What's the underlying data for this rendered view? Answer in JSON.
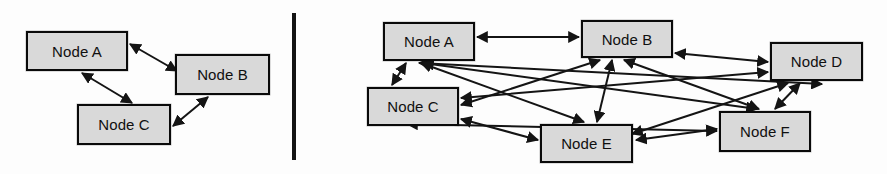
{
  "figure": {
    "background_color": "#fdfdfd",
    "width": 887,
    "height": 174
  },
  "style": {
    "node_fill": "#d9d9d9",
    "node_stroke": "#0a0a0a",
    "edge_color": "#141414",
    "label_color": "#101010",
    "divider_color": "#141414"
  },
  "divider": {
    "name": "panel-divider",
    "x": 292,
    "y": 13,
    "width": 4,
    "height": 147
  },
  "panels": [
    {
      "id": "left-panel",
      "name": "three-node-graph",
      "nodes": [
        {
          "id": "L-A",
          "label": "Node A",
          "x": 26,
          "y": 31,
          "w": 102,
          "h": 40
        },
        {
          "id": "L-B",
          "label": "Node B",
          "x": 175,
          "y": 54,
          "w": 95,
          "h": 41
        },
        {
          "id": "L-C",
          "label": "Node C",
          "x": 77,
          "y": 104,
          "w": 94,
          "h": 41
        }
      ],
      "edges": [
        {
          "from": "L-A",
          "to": "L-B",
          "type": "bidirectional",
          "x1": 130,
          "y1": 44,
          "x2": 177,
          "y2": 71
        },
        {
          "from": "L-A",
          "to": "L-C",
          "type": "bidirectional",
          "x1": 82,
          "y1": 73,
          "x2": 132,
          "y2": 103
        },
        {
          "from": "L-B",
          "to": "L-C",
          "type": "bidirectional",
          "x1": 208,
          "y1": 97,
          "x2": 173,
          "y2": 126
        }
      ]
    },
    {
      "id": "right-panel",
      "name": "six-node-graph",
      "nodes": [
        {
          "id": "R-A",
          "label": "Node A",
          "x": 383,
          "y": 22,
          "w": 92,
          "h": 39
        },
        {
          "id": "R-B",
          "label": "Node B",
          "x": 581,
          "y": 20,
          "w": 92,
          "h": 38
        },
        {
          "id": "R-D",
          "label": "Node D",
          "x": 770,
          "y": 42,
          "w": 93,
          "h": 39
        },
        {
          "id": "R-C",
          "label": "Node C",
          "x": 367,
          "y": 87,
          "w": 92,
          "h": 39
        },
        {
          "id": "R-E",
          "label": "Node E",
          "x": 540,
          "y": 124,
          "w": 93,
          "h": 39
        },
        {
          "id": "R-F",
          "label": "Node F",
          "x": 719,
          "y": 111,
          "w": 92,
          "h": 41
        }
      ],
      "edges": [
        {
          "from": "R-A",
          "to": "R-B",
          "type": "bidirectional",
          "x1": 477,
          "y1": 37,
          "x2": 579,
          "y2": 37
        },
        {
          "from": "R-A",
          "to": "R-C",
          "type": "bidirectional",
          "x1": 406,
          "y1": 63,
          "x2": 392,
          "y2": 85
        },
        {
          "from": "R-A",
          "to": "R-D",
          "type": "bidirectional",
          "x1": 419,
          "y1": 63,
          "x2": 822,
          "y2": 84
        },
        {
          "from": "R-A",
          "to": "R-E",
          "type": "bidirectional",
          "x1": 421,
          "y1": 63,
          "x2": 584,
          "y2": 122
        },
        {
          "from": "R-A",
          "to": "R-F",
          "type": "bidirectional",
          "x1": 423,
          "y1": 63,
          "x2": 757,
          "y2": 109
        },
        {
          "from": "R-B",
          "to": "R-C",
          "type": "bidirectional",
          "x1": 600,
          "y1": 60,
          "x2": 461,
          "y2": 105
        },
        {
          "from": "R-B",
          "to": "R-D",
          "type": "bidirectional",
          "x1": 675,
          "y1": 53,
          "x2": 768,
          "y2": 62
        },
        {
          "from": "R-B",
          "to": "R-E",
          "type": "bidirectional",
          "x1": 612,
          "y1": 60,
          "x2": 597,
          "y2": 122
        },
        {
          "from": "R-B",
          "to": "R-F",
          "type": "bidirectional",
          "x1": 624,
          "y1": 60,
          "x2": 759,
          "y2": 109
        },
        {
          "from": "R-C",
          "to": "R-D",
          "type": "bidirectional",
          "x1": 461,
          "y1": 98,
          "x2": 768,
          "y2": 72
        },
        {
          "from": "R-C",
          "to": "R-E",
          "type": "bidirectional",
          "x1": 461,
          "y1": 119,
          "x2": 538,
          "y2": 140
        },
        {
          "from": "R-C",
          "to": "R-F",
          "type": "bidirectional",
          "x1": 407,
          "y1": 124,
          "x2": 717,
          "y2": 131
        },
        {
          "from": "R-D",
          "to": "R-E",
          "type": "bidirectional",
          "x1": 788,
          "y1": 83,
          "x2": 632,
          "y2": 134
        },
        {
          "from": "R-D",
          "to": "R-F",
          "type": "bidirectional",
          "x1": 800,
          "y1": 83,
          "x2": 775,
          "y2": 109
        },
        {
          "from": "R-E",
          "to": "R-F",
          "type": "bidirectional",
          "x1": 636,
          "y1": 140,
          "x2": 717,
          "y2": 129
        }
      ]
    }
  ]
}
